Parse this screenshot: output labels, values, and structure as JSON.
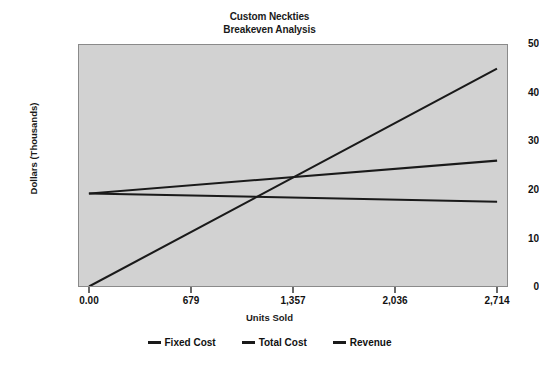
{
  "chart_data": {
    "type": "line",
    "title": "Custom Neckties\nBreakeven Analysis",
    "title_line1": "Custom Neckties",
    "title_line2": "Breakeven Analysis",
    "xlabel": "Units Sold",
    "ylabel": "Dollars (Thousands)",
    "xlim": [
      0,
      2714
    ],
    "ylim": [
      0,
      50
    ],
    "xticks": [
      0,
      679,
      1357,
      2036,
      2714
    ],
    "xtick_labels": [
      "0.00",
      "679",
      "1,357",
      "2,036",
      "2,714"
    ],
    "yticks": [
      0,
      10,
      20,
      30,
      40,
      50
    ],
    "ytick_labels": [
      "0",
      "10",
      "20",
      "30",
      "40",
      "50"
    ],
    "grid": false,
    "legend_position": "bottom",
    "plot_background": "#d2d2d2",
    "line_color": "#1a1a1a",
    "x": [
      0,
      2714
    ],
    "series": [
      {
        "name": "Fixed Cost",
        "values": [
          19.2,
          17.5
        ]
      },
      {
        "name": "Total Cost",
        "values": [
          19.2,
          26.0
        ]
      },
      {
        "name": "Revenue",
        "values": [
          0.0,
          45.0
        ]
      }
    ],
    "annotations": [
      {
        "label": "breakeven",
        "x": 1400,
        "y": 23.0
      }
    ]
  },
  "legend": {
    "items": [
      {
        "label": "Fixed Cost"
      },
      {
        "label": "Total Cost"
      },
      {
        "label": "Revenue"
      }
    ]
  }
}
